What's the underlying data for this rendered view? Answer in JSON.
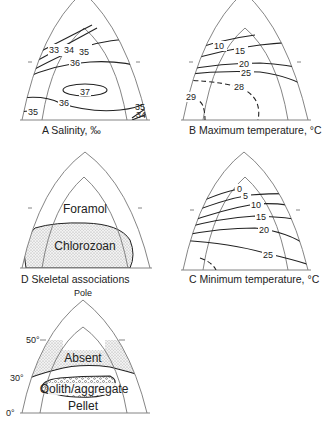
{
  "panels": {
    "a": {
      "caption": "A Salinity, ‰",
      "labels": [
        "33",
        "34",
        "35",
        "36",
        "37",
        "36",
        "35",
        "35",
        "34"
      ]
    },
    "b": {
      "caption": "B Maximum temperature, °C",
      "labels": [
        "10",
        "15",
        "20",
        "25",
        "28",
        "29"
      ]
    },
    "c": {
      "caption": "C Minimum temperature, °C",
      "labels": [
        "0",
        "5",
        "10",
        "15",
        "20",
        "25"
      ]
    },
    "d": {
      "caption": "D Skeletal associations",
      "labels": [
        "Foramol",
        "Chlorozoan"
      ]
    },
    "e": {
      "pole_label": "Pole",
      "lat_labels": [
        "50°",
        "30°",
        "0°"
      ],
      "labels": [
        "Absent",
        "Oolith/aggregate",
        "Pellet"
      ]
    }
  },
  "colors": {
    "frame": "#777777",
    "isoline": "#222222",
    "stipple": "#cfcfcf"
  }
}
